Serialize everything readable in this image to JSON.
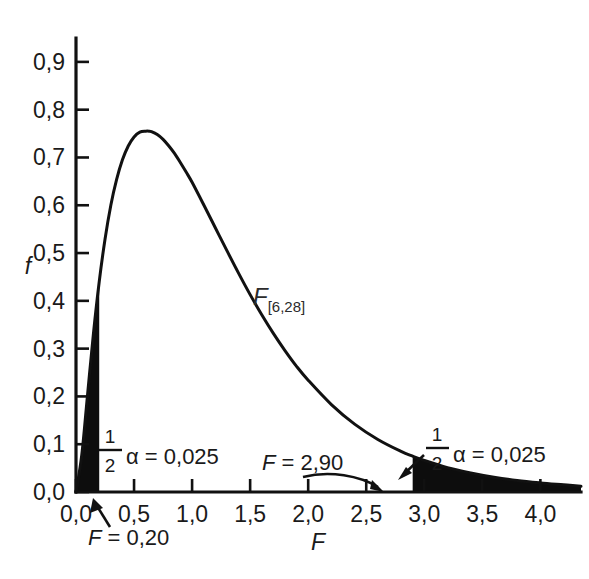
{
  "chart_data": {
    "type": "line",
    "title": "",
    "xlabel": "F",
    "ylabel": "f",
    "xlim": [
      0.0,
      4.35
    ],
    "ylim": [
      0.0,
      0.95
    ],
    "grid": false,
    "legend_position": "none",
    "curve_label": "F",
    "curve_label_sub": "[6,28]",
    "distribution": "F-distribution with df1 = 6, df2 = 28",
    "x_ticks": [
      "0,0",
      "0,5",
      "1,0",
      "1,5",
      "2,0",
      "2,5",
      "3,0",
      "3,5",
      "4,0"
    ],
    "x_tick_values": [
      0.0,
      0.5,
      1.0,
      1.5,
      2.0,
      2.5,
      3.0,
      3.5,
      4.0
    ],
    "y_ticks": [
      "0,0",
      "0,1",
      "0,2",
      "0,3",
      "0,4",
      "0,5",
      "0,6",
      "0,7",
      "0,8",
      "0,9"
    ],
    "y_tick_values": [
      0.0,
      0.1,
      0.2,
      0.3,
      0.4,
      0.5,
      0.6,
      0.7,
      0.8,
      0.9
    ],
    "x": [
      0.0,
      0.05,
      0.1,
      0.15,
      0.2,
      0.25,
      0.3,
      0.35,
      0.4,
      0.45,
      0.5,
      0.55,
      0.6,
      0.63,
      0.65,
      0.7,
      0.75,
      0.8,
      0.85,
      0.9,
      0.95,
      1.0,
      1.1,
      1.2,
      1.3,
      1.4,
      1.5,
      1.6,
      1.7,
      1.8,
      1.9,
      2.0,
      2.2,
      2.4,
      2.6,
      2.8,
      2.9,
      3.0,
      3.2,
      3.4,
      3.6,
      3.8,
      4.0,
      4.2,
      4.35
    ],
    "y": [
      0.0,
      0.078,
      0.205,
      0.331,
      0.44,
      0.529,
      0.6,
      0.654,
      0.695,
      0.724,
      0.743,
      0.753,
      0.755,
      0.755,
      0.754,
      0.748,
      0.738,
      0.724,
      0.708,
      0.689,
      0.669,
      0.648,
      0.601,
      0.553,
      0.505,
      0.458,
      0.413,
      0.371,
      0.332,
      0.296,
      0.263,
      0.234,
      0.183,
      0.142,
      0.11,
      0.085,
      0.075,
      0.066,
      0.051,
      0.04,
      0.031,
      0.024,
      0.019,
      0.015,
      0.012
    ],
    "peak": {
      "x": 0.63,
      "y": 0.755
    },
    "shaded_regions": [
      {
        "name": "lower-tail",
        "from": 0.0,
        "to": 0.2,
        "area": 0.025,
        "label": "1/2 alpha = 0,025"
      },
      {
        "name": "upper-tail",
        "from": 2.9,
        "to": 4.35,
        "area": 0.025,
        "label": "1/2 alpha = 0,025"
      }
    ],
    "annotations": [
      {
        "name": "lower-critical-value",
        "text_prefix": "F",
        "text_rest": " = 0,20",
        "at_x": 0.2,
        "at_y": 0.0
      },
      {
        "name": "upper-critical-value",
        "text_prefix": "F",
        "text_rest": " = 2,90",
        "at_x": 2.9,
        "at_y": 0.0
      },
      {
        "name": "lower-alpha",
        "numerator": "1",
        "denominator": "2",
        "text": "α = 0,025"
      },
      {
        "name": "upper-alpha",
        "numerator": "1",
        "denominator": "2",
        "text": "α = 0,025"
      }
    ]
  },
  "axes": {
    "y_title": "f",
    "x_title": "F",
    "y_labels": [
      "0,9",
      "0,8",
      "0,7",
      "0,6",
      "0,5",
      "0,4",
      "0,3",
      "0,2",
      "0,1",
      "0,0"
    ],
    "x_labels": [
      "0,0",
      "0,5",
      "1,0",
      "1,5",
      "2,0",
      "2,5",
      "3,0",
      "3,5",
      "4,0"
    ]
  },
  "labels": {
    "curve_main": "F",
    "curve_sub": "[6,28]",
    "alpha_left_num": "1",
    "alpha_left_den": "2",
    "alpha_left_text": "α = 0,025",
    "alpha_right_num": "1",
    "alpha_right_den": "2",
    "alpha_right_text": "α = 0,025",
    "f_low_italic": "F",
    "f_low_rest": " = 0,20",
    "f_high_italic": "F",
    "f_high_rest": " = 2,90"
  },
  "colors": {
    "ink": "#1a1a1a",
    "axis": "#111111",
    "shade": "#0d0d0d",
    "background": "#ffffff"
  }
}
